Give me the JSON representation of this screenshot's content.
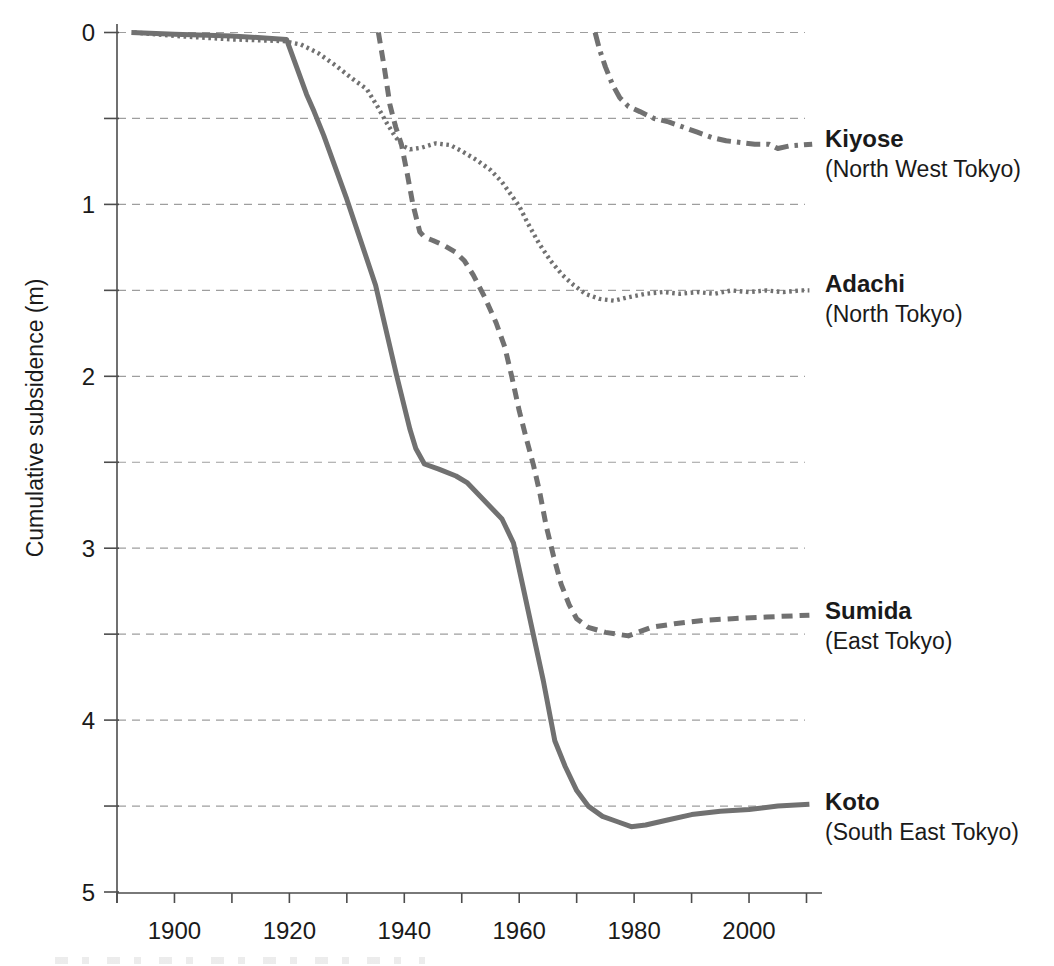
{
  "chart_data": {
    "type": "line",
    "title": "",
    "xlabel": "",
    "ylabel": "Cumulative subsidence (m)",
    "xlim": [
      1890,
      2012
    ],
    "ylim": [
      0,
      5
    ],
    "y_axis_inverted_downward": true,
    "grid": "horizontal dashed lines every 0.5 m",
    "legend_position": "right of line ends",
    "x_tick_labels": [
      1900,
      1920,
      1940,
      1960,
      1980,
      2000
    ],
    "x_minor_tick_years": [
      1890,
      1900,
      1910,
      1920,
      1930,
      1940,
      1950,
      1960,
      1970,
      1980,
      1990,
      2000,
      2010
    ],
    "y_tick_labels": [
      0,
      1,
      2,
      3,
      4,
      5
    ],
    "y_grid_step": 0.5,
    "colors": {
      "series_gray": "#717171",
      "grid_gray": "#9e9e9e",
      "axis_gray": "#4d4d4d",
      "text": "#1a1a1a"
    },
    "series": [
      {
        "name": "Kiyose",
        "region": "(North West Tokyo)",
        "line_style": "dash-dot",
        "points": [
          [
            1973.2,
            0
          ],
          [
            1974,
            0.1
          ],
          [
            1975,
            0.2
          ],
          [
            1976.2,
            0.3
          ],
          [
            1977.5,
            0.38
          ],
          [
            1979,
            0.43
          ],
          [
            1981,
            0.46
          ],
          [
            1983.5,
            0.5
          ],
          [
            1986,
            0.52
          ],
          [
            1988.5,
            0.55
          ],
          [
            1991,
            0.58
          ],
          [
            1993.5,
            0.61
          ],
          [
            1996,
            0.63
          ],
          [
            1998.5,
            0.64
          ],
          [
            2001,
            0.65
          ],
          [
            2003.5,
            0.65
          ],
          [
            2005,
            0.675
          ],
          [
            2007,
            0.66
          ],
          [
            2009,
            0.655
          ],
          [
            2011,
            0.65
          ]
        ]
      },
      {
        "name": "Adachi",
        "region": "(North Tokyo)",
        "line_style": "dotted",
        "points": [
          [
            1893,
            0
          ],
          [
            1900,
            0.02
          ],
          [
            1910,
            0.04
          ],
          [
            1919,
            0.05
          ],
          [
            1922,
            0.07
          ],
          [
            1925,
            0.12
          ],
          [
            1928,
            0.19
          ],
          [
            1931,
            0.27
          ],
          [
            1933.5,
            0.33
          ],
          [
            1935.5,
            0.44
          ],
          [
            1937,
            0.53
          ],
          [
            1938.5,
            0.61
          ],
          [
            1939.8,
            0.66
          ],
          [
            1941,
            0.68
          ],
          [
            1943,
            0.67
          ],
          [
            1945.5,
            0.645
          ],
          [
            1948,
            0.655
          ],
          [
            1950,
            0.69
          ],
          [
            1952.5,
            0.74
          ],
          [
            1955,
            0.8
          ],
          [
            1957,
            0.87
          ],
          [
            1958.5,
            0.94
          ],
          [
            1960,
            1.01
          ],
          [
            1961.5,
            1.11
          ],
          [
            1963.5,
            1.23
          ],
          [
            1965.5,
            1.33
          ],
          [
            1967.5,
            1.41
          ],
          [
            1969.5,
            1.47
          ],
          [
            1971.5,
            1.52
          ],
          [
            1974,
            1.55
          ],
          [
            1976.5,
            1.56
          ],
          [
            1979,
            1.54
          ],
          [
            1982,
            1.52
          ],
          [
            1985,
            1.51
          ],
          [
            1988,
            1.52
          ],
          [
            1991,
            1.51
          ],
          [
            1994,
            1.52
          ],
          [
            1997,
            1.5
          ],
          [
            2000,
            1.51
          ],
          [
            2003,
            1.5
          ],
          [
            2006,
            1.51
          ],
          [
            2009,
            1.5
          ],
          [
            2010.5,
            1.5
          ]
        ]
      },
      {
        "name": "Sumida",
        "region": "(East Tokyo)",
        "line_style": "dashed",
        "points": [
          [
            1935.5,
            0
          ],
          [
            1936.5,
            0.2
          ],
          [
            1937.5,
            0.42
          ],
          [
            1938.5,
            0.55
          ],
          [
            1939.5,
            0.65
          ],
          [
            1940.5,
            0.82
          ],
          [
            1941.5,
            1.0
          ],
          [
            1942.7,
            1.16
          ],
          [
            1943.5,
            1.19
          ],
          [
            1945,
            1.21
          ],
          [
            1947,
            1.24
          ],
          [
            1949,
            1.28
          ],
          [
            1950.5,
            1.33
          ],
          [
            1952,
            1.41
          ],
          [
            1954,
            1.54
          ],
          [
            1956,
            1.69
          ],
          [
            1957.5,
            1.83
          ],
          [
            1958.7,
            2.0
          ],
          [
            1960,
            2.2
          ],
          [
            1961.3,
            2.37
          ],
          [
            1962.5,
            2.52
          ],
          [
            1963.6,
            2.68
          ],
          [
            1964.7,
            2.87
          ],
          [
            1966,
            3.05
          ],
          [
            1967.3,
            3.21
          ],
          [
            1968.7,
            3.33
          ],
          [
            1970,
            3.41
          ],
          [
            1972,
            3.46
          ],
          [
            1975,
            3.49
          ],
          [
            1979,
            3.51
          ],
          [
            1983,
            3.46
          ],
          [
            1987,
            3.44
          ],
          [
            1992,
            3.42
          ],
          [
            1997,
            3.41
          ],
          [
            2003,
            3.4
          ],
          [
            2010.5,
            3.39
          ]
        ]
      },
      {
        "name": "Koto",
        "region": "(South East Tokyo)",
        "line_style": "solid",
        "points": [
          [
            1892.5,
            0
          ],
          [
            1900,
            0.01
          ],
          [
            1910,
            0.02
          ],
          [
            1919.5,
            0.04
          ],
          [
            1923,
            0.36
          ],
          [
            1924.3,
            0.46
          ],
          [
            1926,
            0.6
          ],
          [
            1930,
            0.97
          ],
          [
            1935,
            1.47
          ],
          [
            1938.7,
            2.0
          ],
          [
            1941,
            2.31
          ],
          [
            1942,
            2.42
          ],
          [
            1943.5,
            2.51
          ],
          [
            1946,
            2.54
          ],
          [
            1949,
            2.58
          ],
          [
            1951,
            2.62
          ],
          [
            1953,
            2.69
          ],
          [
            1955,
            2.76
          ],
          [
            1957,
            2.83
          ],
          [
            1959,
            2.97
          ],
          [
            1960.5,
            3.2
          ],
          [
            1962.5,
            3.51
          ],
          [
            1964.2,
            3.77
          ],
          [
            1966.2,
            4.12
          ],
          [
            1968,
            4.27
          ],
          [
            1970,
            4.41
          ],
          [
            1972,
            4.5
          ],
          [
            1974.5,
            4.56
          ],
          [
            1977,
            4.59
          ],
          [
            1979.5,
            4.62
          ],
          [
            1982,
            4.61
          ],
          [
            1986,
            4.58
          ],
          [
            1990,
            4.55
          ],
          [
            1995,
            4.53
          ],
          [
            2000,
            4.52
          ],
          [
            2005,
            4.5
          ],
          [
            2010.5,
            4.49
          ]
        ]
      }
    ]
  }
}
